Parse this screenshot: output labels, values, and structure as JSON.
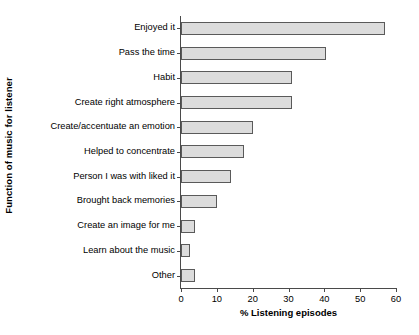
{
  "chart_data": {
    "type": "bar",
    "orientation": "horizontal",
    "title": "",
    "xlabel": "% Listening episodes",
    "ylabel": "Function of music for listener",
    "xlim": [
      0,
      60
    ],
    "xticks": [
      0,
      10,
      20,
      30,
      40,
      50,
      60
    ],
    "grid": false,
    "legend": null,
    "categories": [
      "Enjoyed it",
      "Pass the time",
      "Habit",
      "Create right atmosphere",
      "Create/accentuate an emotion",
      "Helped to concentrate",
      "Person I was with liked it",
      "Brought back memories",
      "Create an image for me",
      "Learn about the music",
      "Other"
    ],
    "values": [
      57,
      40.5,
      31,
      31,
      20,
      17.5,
      14,
      10,
      3.8,
      2.5,
      4
    ],
    "bar_fill": "#dcdcdc",
    "bar_edge": "#5a5a5a",
    "axis_color": "#4a4a4a",
    "background": "#ffffff"
  }
}
